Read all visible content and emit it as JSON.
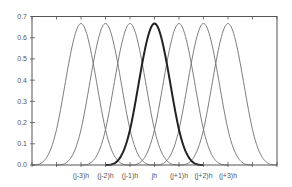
{
  "chart_data": {
    "type": "line",
    "title": "",
    "xlabel": "",
    "ylabel": "",
    "ylim": [
      0.0,
      0.7
    ],
    "yticks": [
      "0.0",
      "0.1",
      "0.2",
      "0.3",
      "0.4",
      "0.5",
      "0.6",
      "0.7"
    ],
    "xlim_in_h": [
      -5,
      5
    ],
    "xtick_count": 11,
    "xtick_labels": [
      {
        "index": 2,
        "label": "(j-3)h"
      },
      {
        "index": 3,
        "label": "(j-2)h"
      },
      {
        "index": 4,
        "label": "(j-1)h"
      },
      {
        "index": 5,
        "label": "jh"
      },
      {
        "index": 6,
        "label": "(j+1)h"
      },
      {
        "index": 7,
        "label": "(j+2)h"
      },
      {
        "index": 8,
        "label": "(j+3)h"
      }
    ],
    "grid": false,
    "legend": null,
    "series": [
      {
        "name": "B_{j-3}",
        "center_h": -3,
        "peak": 0.667,
        "support_h": 2,
        "bold": false
      },
      {
        "name": "B_{j-2}",
        "center_h": -2,
        "peak": 0.667,
        "support_h": 2,
        "bold": false
      },
      {
        "name": "B_{j-1}",
        "center_h": -1,
        "peak": 0.667,
        "support_h": 2,
        "bold": false
      },
      {
        "name": "B_{j}",
        "center_h": 0,
        "peak": 0.667,
        "support_h": 2,
        "bold": true
      },
      {
        "name": "B_{j+1}",
        "center_h": 1,
        "peak": 0.667,
        "support_h": 2,
        "bold": false
      },
      {
        "name": "B_{j+2}",
        "center_h": 2,
        "peak": 0.667,
        "support_h": 2,
        "bold": false
      },
      {
        "name": "B_{j+3}",
        "center_h": 3,
        "peak": 0.667,
        "support_h": 2,
        "bold": false
      }
    ],
    "colors": {
      "thin_line": "#6e6e6e",
      "bold_line": "#222222",
      "axis": "#555555"
    }
  }
}
